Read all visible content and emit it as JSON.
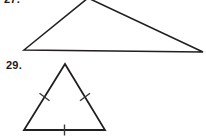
{
  "page": {
    "width": 206,
    "height": 138,
    "background_color": "#ffffff",
    "stroke_color": "#231f20",
    "label_color": "#1a1a1a"
  },
  "figures": [
    {
      "number_label": "27.",
      "shape": "triangle",
      "classification": "scalene-obtuse",
      "clipped_at_top": true,
      "vertices": [
        {
          "name": "left-vertex",
          "x": 24,
          "y": 50
        },
        {
          "name": "apex-vertex",
          "x": 88,
          "y": -2
        },
        {
          "name": "right-vertex",
          "x": 203,
          "y": 52
        }
      ],
      "stroke_width": 1.6,
      "tick_marks": []
    },
    {
      "number_label": "29.",
      "shape": "triangle",
      "classification": "equilateral",
      "clipped_at_top": false,
      "vertices": [
        {
          "name": "apex-vertex",
          "x": 65,
          "y": 64
        },
        {
          "name": "bottom-left-vertex",
          "x": 24,
          "y": 130
        },
        {
          "name": "bottom-right-vertex",
          "x": 105,
          "y": 130
        }
      ],
      "stroke_width": 1.8,
      "tick_marks": [
        {
          "name": "left-side-tick",
          "side": "left",
          "count": 1,
          "cx": 44.5,
          "cy": 97,
          "angle_deg": 58
        },
        {
          "name": "right-side-tick",
          "side": "right",
          "count": 1,
          "cx": 85,
          "cy": 97,
          "angle_deg": -58
        },
        {
          "name": "base-tick",
          "side": "base",
          "count": 1,
          "cx": 64.5,
          "cy": 130,
          "angle_deg": 0
        }
      ]
    }
  ]
}
